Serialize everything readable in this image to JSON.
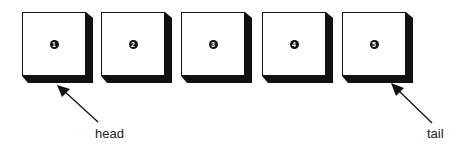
{
  "diagram": {
    "type": "linked-list-queue",
    "nodes": [
      {
        "id": 1,
        "label": "1",
        "x": 22
      },
      {
        "id": 2,
        "label": "2",
        "x": 101
      },
      {
        "id": 3,
        "label": "3",
        "x": 181
      },
      {
        "id": 4,
        "label": "4",
        "x": 262
      },
      {
        "id": 5,
        "label": "5",
        "x": 342
      }
    ],
    "pointers": {
      "head": {
        "label": "head",
        "points_to": 1
      },
      "tail": {
        "label": "tail",
        "points_to": 5
      }
    }
  }
}
